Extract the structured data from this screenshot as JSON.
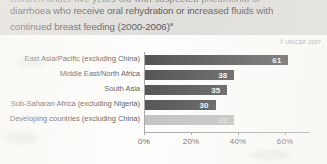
{
  "document": {
    "clipped_top_line": "children under five years old with suspected pneumonia or",
    "title_line_1": "diarrhoea who receive oral rehydration or increased fluids with",
    "title_line_2": "continued breast feeding (2000-2006)",
    "title_superscript": "a",
    "copyright": "© UNICEF 2007"
  },
  "chart_data": {
    "type": "bar",
    "orientation": "horizontal",
    "title": "diarrhoea who receive oral rehydration or increased fluids with continued breast feeding (2000-2006)",
    "xlabel": "",
    "ylabel": "",
    "xlim": [
      0,
      70
    ],
    "grid": false,
    "legend": "none",
    "tick_labels": [
      "0%",
      "20%",
      "40%",
      "60%"
    ],
    "tick_values": [
      0,
      20,
      40,
      60
    ],
    "categories": [
      "East Asia/Pacific (excluding China)",
      "Middle East/North Africa",
      "South Asia",
      "Sub-Saharan Africa (excluding Nigeria)",
      "Developing countries (excluding China)"
    ],
    "values": [
      61,
      38,
      35,
      30,
      38
    ],
    "value_labels": [
      "61",
      "38",
      "35",
      "30",
      "38"
    ],
    "bar_styles": [
      "dark",
      "dark",
      "dark",
      "dark",
      "light"
    ],
    "colors": {
      "bar_dark": "#38383a",
      "bar_light": "#b9b9b7",
      "axis": "#9a9a9a",
      "title_band": "#d9d8d4",
      "text": "#3c3c42"
    }
  }
}
